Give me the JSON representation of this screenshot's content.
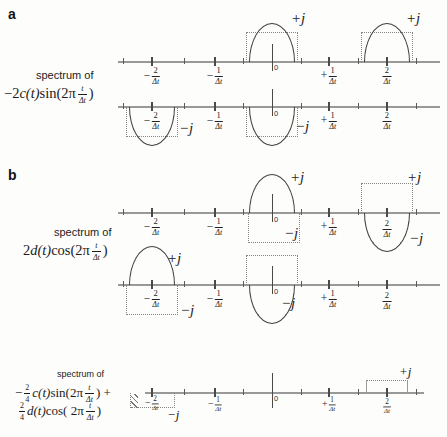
{
  "panel_letters": {
    "a": "a",
    "b": "b"
  },
  "panels": {
    "a": {
      "caption": "spectrum of",
      "formula": {
        "coef": "−2",
        "var": "c(t)",
        "trig": "sin(2π",
        "arg": {
          "num": "t",
          "den": "Δt"
        },
        "close": ")"
      }
    },
    "b": {
      "caption": "spectrum of",
      "formula": {
        "coef": "2",
        "var": "d(t)",
        "trig": "cos(2π",
        "arg": {
          "num": "t",
          "den": "Δt"
        },
        "close": ")"
      }
    },
    "c": {
      "caption": "spectrum of",
      "line1": {
        "pre": "−",
        "coef": {
          "num": "2",
          "den": "4"
        },
        "var": "c(t)",
        "trig": "sin(2π",
        "arg": {
          "num": "t",
          "den": "Δt"
        },
        "close": ") +"
      },
      "line2": {
        "pre": "",
        "coef": {
          "num": "2",
          "den": "4"
        },
        "var": "d(t)",
        "trig": "cos( 2π",
        "arg": {
          "num": "t",
          "den": "Δt"
        },
        "close": ")"
      }
    }
  },
  "ticks": {
    "neg2": {
      "sign": "−",
      "num": "2",
      "den": "Δt"
    },
    "neg1": {
      "sign": "−",
      "num": "1",
      "den": "Δt"
    },
    "zero": "0",
    "pos1": {
      "sign": "+",
      "num": "1",
      "den": "Δt"
    },
    "pos2": {
      "sign": "",
      "num": "2",
      "den": "Δt"
    }
  },
  "lobe_labels": {
    "plus_j": "+j",
    "minus_j": "−j"
  },
  "spectra": {
    "row_a1": {
      "lobes": [
        {
          "freq": "0",
          "side": "above",
          "label": "+j",
          "dotted_box": true
        },
        {
          "freq": "2/Δt",
          "side": "above",
          "label": "+j",
          "dotted_box": true
        }
      ]
    },
    "row_a2": {
      "lobes": [
        {
          "freq": "−2/Δt",
          "side": "below",
          "label": "−j",
          "dotted_box": true
        },
        {
          "freq": "0",
          "side": "below",
          "label": "−j",
          "dotted_box": true
        }
      ]
    },
    "row_b1": {
      "lobes": [
        {
          "freq": "0",
          "side": "above",
          "label": "+j",
          "dotted_box": false
        },
        {
          "freq": "0",
          "side": "below",
          "label": "−j",
          "phantom_only": true
        },
        {
          "freq": "2/Δt",
          "side": "above",
          "label": "+j",
          "phantom_only": true
        },
        {
          "freq": "2/Δt",
          "side": "below",
          "label": "−j",
          "dotted_box": false
        }
      ]
    },
    "row_b2": {
      "lobes": [
        {
          "freq": "−2/Δt",
          "side": "above",
          "label": "+j",
          "dotted_box": false
        },
        {
          "freq": "−2/Δt",
          "side": "below",
          "label": "−j",
          "phantom_only": true
        },
        {
          "freq": "0",
          "side": "above",
          "label": "",
          "phantom_only": true
        },
        {
          "freq": "0",
          "side": "below",
          "label": "−j",
          "dotted_box": false
        }
      ]
    },
    "row_c": {
      "lobes": [
        {
          "freq": "−2/Δt",
          "side": "below",
          "label": "−j",
          "phantom_only": true,
          "shallow": true,
          "hatched": true
        },
        {
          "freq": "2/Δt",
          "side": "above",
          "label": "+j",
          "phantom_only": true,
          "shallow": true
        }
      ]
    }
  },
  "colors": {
    "axis": "#999999",
    "curve": "#3d3d3d",
    "phantom": "#858585",
    "text": "#1c1c1c"
  }
}
